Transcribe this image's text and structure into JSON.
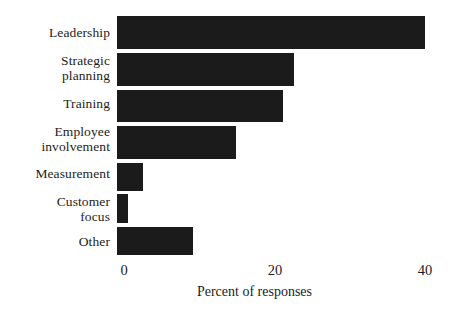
{
  "chart_data": {
    "type": "bar",
    "orientation": "horizontal",
    "title": "",
    "subtitle": "",
    "xlabel": "Percent of responses",
    "ylabel": "",
    "categories": [
      "Leadership",
      "Strategic planning",
      "Training",
      "Employee involvement",
      "Measurement",
      "Customer focus",
      "Other"
    ],
    "category_lines": [
      [
        "Leadership"
      ],
      [
        "Strategic",
        "planning"
      ],
      [
        "Training"
      ],
      [
        "Employee",
        "involvement"
      ],
      [
        "Measurement"
      ],
      [
        "Customer",
        "focus"
      ],
      [
        "Other"
      ]
    ],
    "values": [
      40,
      23,
      21.5,
      15.5,
      3.4,
      1.4,
      9.9
    ],
    "xlim": [
      0,
      40
    ],
    "xticks": [
      0,
      20,
      40
    ],
    "xtick_labels": [
      "0",
      "20",
      "40"
    ],
    "grid": false,
    "legend": "none",
    "bar_color": "#1b1b1b",
    "background_color": "#ffffff",
    "text_color": "#1c1c1c"
  },
  "axis": {
    "x_title": "Percent of responses",
    "ticks": [
      {
        "label": "0",
        "value": 0
      },
      {
        "label": "20",
        "value": 20
      },
      {
        "label": "40",
        "value": 40
      }
    ]
  }
}
